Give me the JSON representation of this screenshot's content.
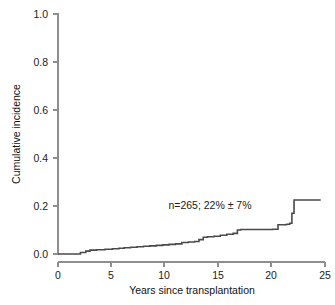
{
  "chart_data": {
    "type": "line",
    "subtype": "cumulative-incidence-step",
    "title": "",
    "xlabel": "Years since transplantation",
    "ylabel": "Cumulative incidence",
    "xlim": [
      0,
      25
    ],
    "ylim": [
      0,
      1.0
    ],
    "xticks": [
      0,
      5,
      10,
      15,
      20,
      25
    ],
    "xtick_labels": [
      "0",
      "5",
      "10",
      "15",
      "20",
      "25"
    ],
    "yticks": [
      0.0,
      0.2,
      0.4,
      0.6,
      0.8,
      1.0
    ],
    "ytick_labels": [
      "0.0",
      "0.2",
      "0.4",
      "0.6",
      "0.8",
      "1.0"
    ],
    "grid": false,
    "legend": false,
    "annotations": [
      {
        "text": "n=265; 22% ± 7%",
        "x": 13.2,
        "y": 0.235
      }
    ],
    "series": [
      {
        "name": "Cumulative incidence",
        "color": "#4a4a4a",
        "step": "post",
        "x": [
          0.0,
          1.6,
          2.1,
          2.6,
          3.0,
          3.6,
          4.4,
          5.1,
          5.7,
          6.2,
          6.8,
          7.4,
          8.0,
          8.6,
          9.2,
          9.8,
          10.4,
          11.0,
          11.6,
          12.2,
          12.8,
          13.2,
          13.6,
          14.0,
          14.6,
          15.2,
          15.8,
          16.4,
          16.8,
          17.1,
          17.6,
          18.6,
          19.6,
          20.1,
          20.6,
          21.4,
          21.7,
          21.9,
          22.1,
          24.6
        ],
        "y": [
          0.0,
          0.0,
          0.006,
          0.012,
          0.016,
          0.018,
          0.02,
          0.022,
          0.024,
          0.026,
          0.028,
          0.03,
          0.032,
          0.034,
          0.036,
          0.038,
          0.04,
          0.042,
          0.048,
          0.05,
          0.052,
          0.06,
          0.07,
          0.072,
          0.074,
          0.078,
          0.082,
          0.086,
          0.1,
          0.102,
          0.102,
          0.102,
          0.102,
          0.103,
          0.122,
          0.124,
          0.128,
          0.17,
          0.225,
          0.225
        ]
      }
    ]
  },
  "axes": {
    "y_title": "Cumulative incidence",
    "x_title": "Years since transplantation"
  }
}
